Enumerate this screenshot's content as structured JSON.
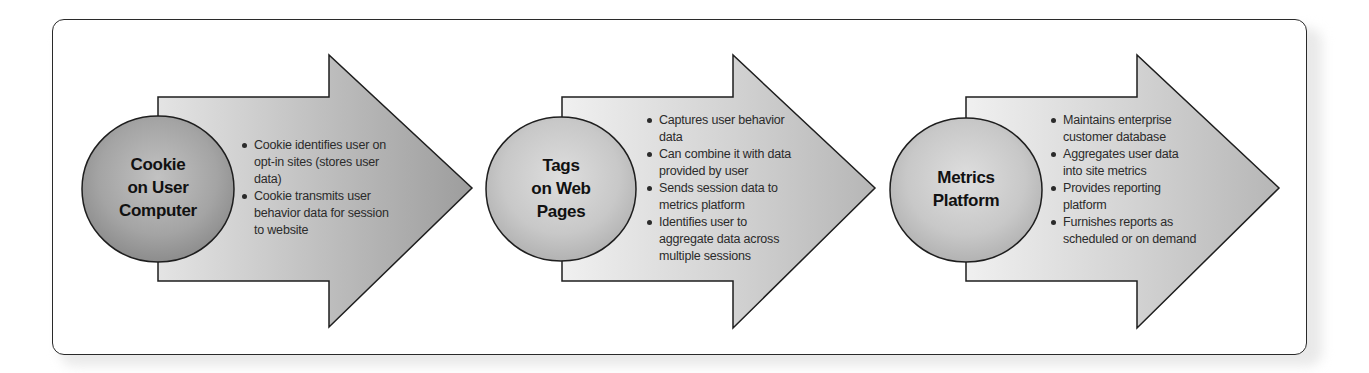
{
  "diagram": {
    "type": "process-flow",
    "colors": {
      "frame_border": "#2a2a2a",
      "frame_bg": "#ffffff",
      "arrow_light": "#ececec",
      "arrow_dark": "#a8a8a8",
      "circle_dark": "#9c9c9c",
      "circle_light": "#c6c6c6",
      "outline": "#1e1e1e",
      "text": "#111111"
    },
    "steps": [
      {
        "title": "Cookie on User Computer",
        "title_lines": [
          "Cookie",
          "on User",
          "Computer"
        ],
        "bullets": [
          "Cookie identifies user on opt-in sites (stores user data)",
          "Cookie transmits user behavior data for session to website"
        ]
      },
      {
        "title": "Tags on Web Pages",
        "title_lines": [
          "Tags",
          "on Web",
          "Pages"
        ],
        "bullets": [
          "Captures user behavior data",
          "Can combine it with data provided by user",
          "Sends session data to metrics platform",
          "Identifies user to aggregate data across multiple sessions"
        ]
      },
      {
        "title": "Metrics Platform",
        "title_lines": [
          "Metrics",
          "Platform"
        ],
        "bullets": [
          "Maintains enterprise customer database",
          "Aggregates user data into site metrics",
          "Provides reporting platform",
          "Furnishes reports as scheduled or on demand"
        ]
      }
    ]
  }
}
